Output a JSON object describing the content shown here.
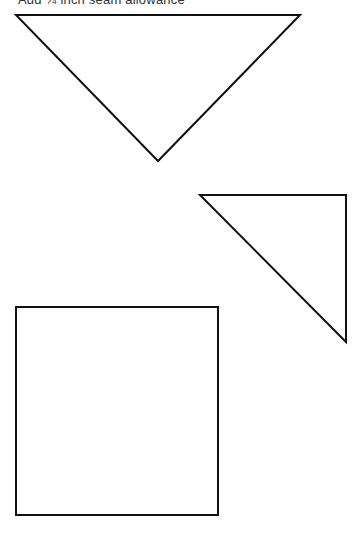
{
  "page": {
    "caption": "Add ¼ inch seam allowance"
  },
  "shapes": [
    {
      "name": "large-triangle",
      "type": "triangle",
      "points": "16,15 300,15 158,161"
    },
    {
      "name": "small-triangle",
      "type": "triangle",
      "points": "200,195 346,195 346,342"
    },
    {
      "name": "square",
      "type": "square",
      "x": 16,
      "y": 307,
      "width": 202,
      "height": 208
    }
  ],
  "colors": {
    "stroke": "#111111",
    "background": "#ffffff"
  }
}
